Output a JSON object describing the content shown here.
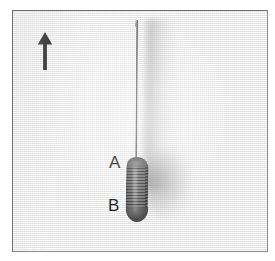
{
  "figure": {
    "kind": "photograph",
    "background_color": "#f4f4f4",
    "frame_border_color": "#6f6f6f",
    "frame": {
      "x": 12,
      "y": 10,
      "width": 256,
      "height": 242
    }
  },
  "orientation": {
    "icon": "up-arrow-icon",
    "direction": "up",
    "color": "#111111",
    "position": {
      "x": 22,
      "y": 20
    }
  },
  "annotations": [
    {
      "id": "label-a",
      "text": "A",
      "color": "#1b1b1b",
      "refers_to": "needle-wire-shaft",
      "position": {
        "x": 96,
        "y": 143
      }
    },
    {
      "id": "label-b",
      "text": "B",
      "color": "#1b1b1b",
      "refers_to": "coil-spring-body",
      "position": {
        "x": 95,
        "y": 186
      }
    }
  ],
  "objects": {
    "needle": {
      "name": "needle-wire",
      "color": "#5a5a5a",
      "orientation": "vertical"
    },
    "coil": {
      "name": "coil-spring-body",
      "color": "#4a4a4a",
      "texture": "horizontal-striations"
    },
    "shadow": {
      "name": "cast-shadow",
      "color": "#8c8c8c",
      "side": "right"
    }
  }
}
